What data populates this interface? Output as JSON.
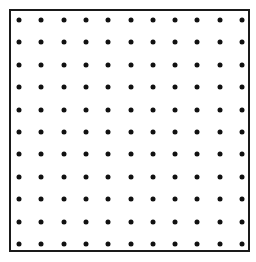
{
  "diagram": {
    "type": "dot-grid",
    "rows": 11,
    "columns": 11,
    "dot_color": "#111111",
    "border_color": "#1a1a1a",
    "background_color": "#ffffff",
    "origin": {
      "x": 19,
      "y": 20
    },
    "spacing": {
      "x": 22.3,
      "y": 22.4
    },
    "dot_diameter": 5
  }
}
